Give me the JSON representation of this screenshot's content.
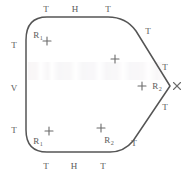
{
  "figure": {
    "stroke_color": "#555555",
    "label_color": "#5a5a5a",
    "background_color": "#ffffff",
    "outline": {
      "description": "Closed polygon with two rounded left corners, a vertical left edge, horizontal top and bottom edges, and a pointed vertex on the right",
      "path": "M 26 40 Q 26 17 47 17 L 108 17 Q 126 17 136 31 L 170 86 L 133 141 Q 124 152 110 152 L 47 152 Q 26 152 26 130 Z"
    },
    "edge_labels": [
      {
        "name": "top-left-T",
        "text": "T",
        "x": 46,
        "y": 9
      },
      {
        "name": "top-center-H",
        "text": "H",
        "x": 75,
        "y": 9
      },
      {
        "name": "top-right-T",
        "text": "T",
        "x": 108,
        "y": 9
      },
      {
        "name": "upper-right-T",
        "text": "T",
        "x": 148,
        "y": 31
      },
      {
        "name": "right-upper-T",
        "text": "T",
        "x": 165,
        "y": 67
      },
      {
        "name": "right-lower-T",
        "text": "T",
        "x": 165,
        "y": 107
      },
      {
        "name": "lower-right-T",
        "text": "T",
        "x": 134,
        "y": 143
      },
      {
        "name": "bottom-right-T",
        "text": "T",
        "x": 103,
        "y": 166
      },
      {
        "name": "bottom-center-H",
        "text": "H",
        "x": 74,
        "y": 166
      },
      {
        "name": "bottom-left-T",
        "text": "T",
        "x": 46,
        "y": 166
      },
      {
        "name": "left-lower-T",
        "text": "T",
        "x": 14,
        "y": 130
      },
      {
        "name": "left-center-V",
        "text": "V",
        "x": 14,
        "y": 88
      },
      {
        "name": "left-upper-T",
        "text": "T",
        "x": 14,
        "y": 45
      }
    ],
    "radius_labels": [
      {
        "name": "radius-top-left",
        "base": "R",
        "sub": "1",
        "x": 38,
        "y": 35
      },
      {
        "name": "radius-bottom-left",
        "base": "R",
        "sub": "1",
        "x": 38,
        "y": 141
      },
      {
        "name": "radius-bottom-right",
        "base": "R",
        "sub": "2",
        "x": 109,
        "y": 140
      },
      {
        "name": "radius-right-vertex",
        "base": "R",
        "sub": "2",
        "x": 157,
        "y": 86
      }
    ],
    "cross_markers": [
      {
        "name": "cross-top-left",
        "x": 47,
        "y": 41
      },
      {
        "name": "cross-upper-mid",
        "x": 115,
        "y": 59
      },
      {
        "name": "cross-right-mid",
        "x": 142,
        "y": 86
      },
      {
        "name": "cross-bottom-left",
        "x": 49,
        "y": 131
      },
      {
        "name": "cross-bottom-mid",
        "x": 101,
        "y": 128
      }
    ],
    "vertex_x_mark": {
      "name": "vertex-x-mark",
      "x": 177,
      "y": 86,
      "size": 7
    }
  }
}
